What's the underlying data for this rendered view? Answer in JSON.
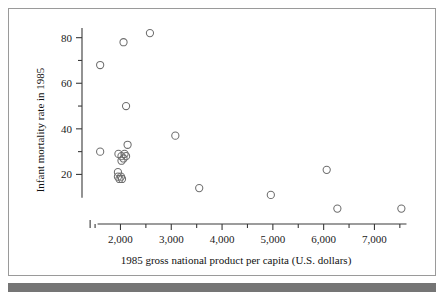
{
  "figure": {
    "background_color": "#ffffff",
    "frame_color": "#9a9a9a",
    "bottom_bar_color": "#757575",
    "marker_color": "#6e6e6e",
    "axis_color": "#3a3a3a"
  },
  "chart_data": {
    "type": "scatter",
    "title": "",
    "xlabel": "1985 gross national product per capita (U.S. dollars)",
    "ylabel": "Infant mortality rate in 1985",
    "xlim": [
      1400,
      7700
    ],
    "ylim": [
      0,
      86
    ],
    "grid": false,
    "legend": null,
    "x_ticks_major": [
      2000,
      3000,
      4000,
      5000,
      6000,
      7000
    ],
    "x_tick_labels": [
      "2,000",
      "3,000",
      "4,000",
      "5,000",
      "6,000",
      "7,000"
    ],
    "x_ticks_minor": [
      1500,
      2500,
      3500,
      4500,
      5500,
      6500,
      7500
    ],
    "y_ticks_major": [
      20,
      40,
      60,
      80
    ],
    "y_tick_labels": [
      "20",
      "40",
      "60",
      "80"
    ],
    "y_ticks_minor": [
      30,
      50,
      70
    ],
    "points": [
      {
        "x": 1600,
        "y": 68
      },
      {
        "x": 2060,
        "y": 78
      },
      {
        "x": 2580,
        "y": 82
      },
      {
        "x": 2110,
        "y": 50
      },
      {
        "x": 3080,
        "y": 37
      },
      {
        "x": 2140,
        "y": 33
      },
      {
        "x": 1600,
        "y": 30
      },
      {
        "x": 1960,
        "y": 29
      },
      {
        "x": 2020,
        "y": 28
      },
      {
        "x": 2080,
        "y": 29
      },
      {
        "x": 2060,
        "y": 27
      },
      {
        "x": 2110,
        "y": 28
      },
      {
        "x": 2020,
        "y": 26
      },
      {
        "x": 1950,
        "y": 21
      },
      {
        "x": 1950,
        "y": 19
      },
      {
        "x": 1980,
        "y": 18
      },
      {
        "x": 2010,
        "y": 19
      },
      {
        "x": 2030,
        "y": 18
      },
      {
        "x": 3550,
        "y": 14
      },
      {
        "x": 4960,
        "y": 11
      },
      {
        "x": 6060,
        "y": 22
      },
      {
        "x": 6270,
        "y": 5
      },
      {
        "x": 7530,
        "y": 5
      }
    ]
  }
}
